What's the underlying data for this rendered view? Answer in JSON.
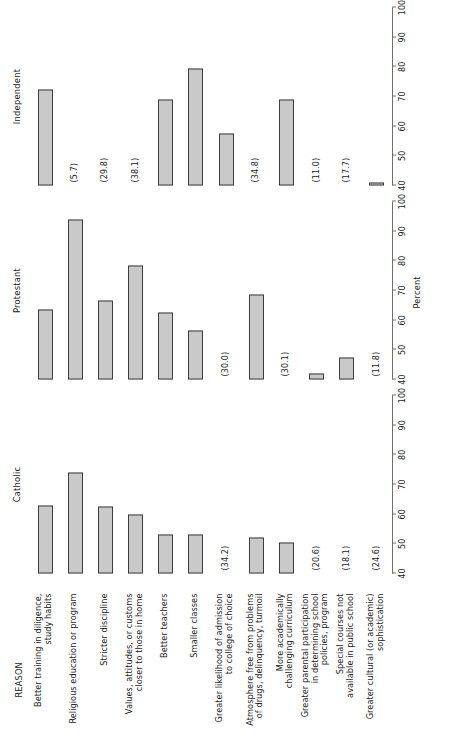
{
  "figure": {
    "reason_header": "REASON",
    "axis_title": "Percent"
  },
  "chart_data": {
    "type": "bar",
    "title": "",
    "xlabel": "Percent",
    "ylabel": "REASON",
    "xlim": [
      40,
      100
    ],
    "xticks": [
      40,
      50,
      60,
      70,
      80,
      90,
      100
    ],
    "grid": false,
    "legend_position": "none",
    "orientation": "horizontal",
    "note": "Bars start at 40. Categories whose value falls below 40 are printed as a parenthetical number instead of a drawn bar.",
    "categories": [
      "Better training in diligence, study habits",
      "Religious education or program",
      "Stricter discipline",
      "Values, attitudes, or customs closer to those in home",
      "Better teachers",
      "Smaller classes",
      "Greater likelihood of admission to college of choice",
      "Atmosphere free from problems of drugs, delinquency, turmoil",
      "More academically challenging curriculum",
      "Greater parental participation in determining school policies, program",
      "Special courses not available in public school",
      "Greater cultural (or academic) sophistication"
    ],
    "category_lines": [
      [
        "Better training in diligence,",
        "study habits"
      ],
      [
        "Religious education or program"
      ],
      [
        "Stricter discipline"
      ],
      [
        "Values, attitudes, or customs",
        "closer to those in home"
      ],
      [
        "Better teachers"
      ],
      [
        "Smaller classes"
      ],
      [
        "Greater likelihood of admission",
        "to college of choice"
      ],
      [
        "Atmosphere free from problems",
        "of drugs, delinquency, turmoil"
      ],
      [
        "More academically",
        "challenging curriculum"
      ],
      [
        "Greater parental participation",
        "in determining school",
        "policies, program"
      ],
      [
        "Special courses not",
        "available in public school"
      ],
      [
        "Greater cultural (or academic)",
        "sophistication"
      ]
    ],
    "series": [
      {
        "name": "Catholic",
        "values": [
          63.0,
          74.0,
          62.5,
          60.0,
          53.0,
          53.0,
          34.2,
          52.0,
          50.5,
          20.6,
          18.1,
          24.6
        ],
        "below_axis_labels": [
          "",
          "",
          "",
          "",
          "",
          "",
          "(34.2)",
          "",
          "",
          "(20.6)",
          "(18.1)",
          "(24.6)"
        ]
      },
      {
        "name": "Protestant",
        "values": [
          63.5,
          94.0,
          66.5,
          78.5,
          62.5,
          56.5,
          30.0,
          68.5,
          30.1,
          42.0,
          47.5,
          11.8
        ],
        "below_axis_labels": [
          "",
          "",
          "",
          "",
          "",
          "",
          "(30.0)",
          "",
          "(30.1)",
          "",
          "",
          "(11.8)"
        ]
      },
      {
        "name": "Independent",
        "values": [
          72.5,
          5.7,
          29.8,
          38.1,
          69.0,
          79.5,
          57.5,
          34.8,
          69.0,
          11.0,
          17.7,
          41.0
        ],
        "below_axis_labels": [
          "",
          "(5.7)",
          "(29.8)",
          "(38.1)",
          "",
          "",
          "",
          "(34.8)",
          "",
          "(11.0)",
          "(17.7)",
          ""
        ]
      }
    ],
    "colors": {
      "bar_fill": "#c9c9c9",
      "bar_edge": "#3d3d3d",
      "axis": "#6e6e6e",
      "text": "#1a1a1a"
    }
  }
}
